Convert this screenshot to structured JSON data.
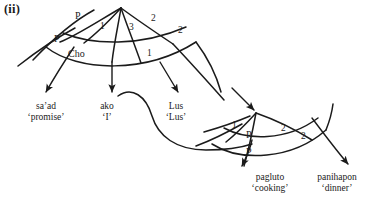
{
  "figure": {
    "enumerator": "(ii)",
    "colors": {
      "stroke": "#1b1b1b",
      "background": "#ffffff",
      "text": "#1b1b1b"
    }
  },
  "arc_labels": [
    {
      "text": "P",
      "x": 75,
      "y": 18,
      "kind": "pp"
    },
    {
      "text": "P",
      "x": 54,
      "y": 41,
      "kind": "pp"
    },
    {
      "text": "1",
      "x": 100,
      "y": 28,
      "kind": "num"
    },
    {
      "text": "3",
      "x": 129,
      "y": 29,
      "kind": "num"
    },
    {
      "text": "2",
      "x": 151,
      "y": 20,
      "kind": "num"
    },
    {
      "text": "2",
      "x": 178,
      "y": 32,
      "kind": "num"
    },
    {
      "text": "Cho",
      "x": 75,
      "y": 56,
      "kind": "cho"
    },
    {
      "text": "1",
      "x": 147,
      "y": 56,
      "kind": "num"
    },
    {
      "text": "1",
      "x": 232,
      "y": 127,
      "kind": "num"
    },
    {
      "text": "P",
      "x": 246,
      "y": 136,
      "kind": "pp"
    },
    {
      "text": "2",
      "x": 281,
      "y": 130,
      "kind": "num"
    },
    {
      "text": "2",
      "x": 301,
      "y": 138,
      "kind": "num"
    },
    {
      "text": "P",
      "x": 246,
      "y": 153,
      "kind": "pp"
    }
  ],
  "glosses": [
    {
      "form": "sa’ad",
      "meaning": "‘promise’",
      "x": 46,
      "y": 101
    },
    {
      "form": "ako",
      "meaning": "‘I’",
      "x": 107,
      "y": 101
    },
    {
      "form": "Lus",
      "meaning": "‘Lus’",
      "x": 176,
      "y": 101
    },
    {
      "form": "pagluto",
      "meaning": "‘cooking’",
      "x": 270,
      "y": 172
    },
    {
      "form": "panihapon",
      "meaning": "‘dinner’",
      "x": 337,
      "y": 172
    }
  ],
  "graph_paths": {
    "upper_node": {
      "x": 121,
      "y": 8
    },
    "lower_node": {
      "x": 256,
      "y": 113
    }
  }
}
